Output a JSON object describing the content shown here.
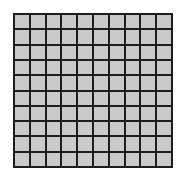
{
  "grid": {
    "rows": 10,
    "columns": 10,
    "cell_color": "#c9c9c9",
    "line_color": "#1e1e1e",
    "background": "#ffffff"
  }
}
